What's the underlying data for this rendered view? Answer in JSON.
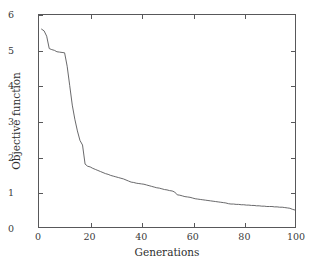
{
  "chart_data": {
    "type": "line",
    "title": "",
    "xlabel": "Generations",
    "ylabel": "Objective function",
    "xlim": [
      0,
      100
    ],
    "ylim": [
      0,
      6
    ],
    "xticks": [
      0,
      20,
      40,
      60,
      80,
      100
    ],
    "yticks": [
      0,
      1,
      2,
      3,
      4,
      5,
      6
    ],
    "xtick_labels": [
      "0",
      "20",
      "40",
      "60",
      "80",
      "100"
    ],
    "ytick_labels": [
      "0",
      "1",
      "2",
      "3",
      "4",
      "5",
      "6"
    ],
    "grid": false,
    "legend": null,
    "line_color": "#58585a",
    "line_width": 0.9,
    "series": [
      {
        "name": "best objective value",
        "x": [
          1,
          2,
          3,
          4,
          5,
          6,
          7,
          8,
          9,
          10,
          11,
          12,
          13,
          14,
          15,
          16,
          17,
          18,
          19,
          20,
          21,
          22,
          23,
          24,
          25,
          26,
          27,
          28,
          29,
          30,
          31,
          32,
          33,
          34,
          35,
          36,
          37,
          38,
          39,
          40,
          41,
          42,
          43,
          44,
          45,
          46,
          47,
          48,
          49,
          50,
          51,
          52,
          53,
          54,
          55,
          56,
          57,
          58,
          59,
          60,
          61,
          62,
          63,
          64,
          65,
          66,
          67,
          68,
          69,
          70,
          71,
          72,
          73,
          74,
          75,
          76,
          77,
          78,
          79,
          80,
          81,
          82,
          83,
          84,
          85,
          86,
          87,
          88,
          89,
          90,
          91,
          92,
          93,
          94,
          95,
          96,
          97,
          98,
          99,
          100
        ],
        "y": [
          5.6,
          5.55,
          5.4,
          5.05,
          5.02,
          5.0,
          4.96,
          4.95,
          4.94,
          4.93,
          4.55,
          4.0,
          3.45,
          3.05,
          2.72,
          2.45,
          2.32,
          1.78,
          1.72,
          1.7,
          1.66,
          1.63,
          1.6,
          1.57,
          1.54,
          1.51,
          1.49,
          1.46,
          1.44,
          1.42,
          1.4,
          1.38,
          1.36,
          1.33,
          1.3,
          1.27,
          1.26,
          1.24,
          1.23,
          1.22,
          1.21,
          1.19,
          1.17,
          1.15,
          1.13,
          1.11,
          1.1,
          1.08,
          1.06,
          1.05,
          1.03,
          1.02,
          0.99,
          0.91,
          0.9,
          0.88,
          0.86,
          0.85,
          0.84,
          0.82,
          0.8,
          0.79,
          0.78,
          0.77,
          0.76,
          0.75,
          0.74,
          0.73,
          0.72,
          0.71,
          0.7,
          0.69,
          0.68,
          0.66,
          0.65,
          0.65,
          0.64,
          0.64,
          0.63,
          0.63,
          0.62,
          0.62,
          0.61,
          0.61,
          0.6,
          0.6,
          0.59,
          0.59,
          0.58,
          0.58,
          0.58,
          0.57,
          0.57,
          0.56,
          0.56,
          0.55,
          0.54,
          0.53,
          0.5,
          0.48
        ]
      }
    ]
  },
  "axes": {
    "y_title": "Objective function",
    "x_title": "Generations"
  }
}
